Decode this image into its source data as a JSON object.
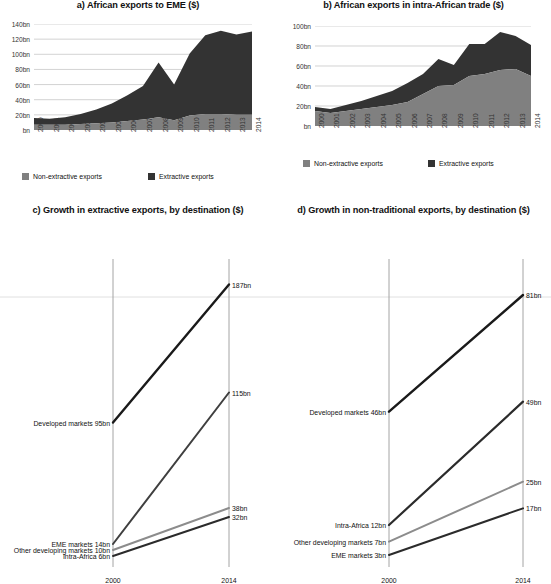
{
  "colors": {
    "non_extractive": "#808080",
    "extractive": "#333333",
    "grid": "#bfbfbf",
    "axis": "#aaaaaa",
    "text": "#111111"
  },
  "panel_a": {
    "title": "a) African exports to EME ($)",
    "ylabels": [
      "140bn",
      "120bn",
      "100bn",
      "80bn",
      "60bn",
      "40bn",
      "20bn",
      "bn"
    ],
    "xlabels": [
      "2000",
      "2001",
      "2002",
      "2003",
      "2004",
      "2005",
      "2006",
      "2007",
      "2008",
      "2009",
      "2010",
      "2011",
      "2012",
      "2013",
      "2014"
    ],
    "legend": [
      {
        "label": "Non-extractive exports",
        "color": "#808080"
      },
      {
        "label": "Extractive exports",
        "color": "#333333"
      }
    ]
  },
  "panel_b": {
    "title": "b) African exports in intra-African trade ($)",
    "ylabels": [
      "100bn",
      "80bn",
      "60bn",
      "40bn",
      "20bn",
      "bn"
    ],
    "xlabels": [
      "2000",
      "2001",
      "2002",
      "2003",
      "2004",
      "2005",
      "2006",
      "2007",
      "2008",
      "2009",
      "2010",
      "2011",
      "2012",
      "2013",
      "2014"
    ],
    "legend": [
      {
        "label": "Non-extractive exports",
        "color": "#808080"
      },
      {
        "label": "Extractive exports",
        "color": "#333333"
      }
    ]
  },
  "panel_c": {
    "title": "c) Growth in extractive exports, by destination ($)",
    "x_start_label": "2000",
    "x_end_label": "2014",
    "series": [
      {
        "name": "Developed markets",
        "left_label": "Developed markets 95bn",
        "right_label": "187bn",
        "start": 95,
        "end": 187,
        "color": "#1a1a1a",
        "width": 2.4
      },
      {
        "name": "EME markets",
        "left_label": "EME markets 14bn",
        "right_label": "115bn",
        "start": 14,
        "end": 115,
        "color": "#3f3f3f",
        "width": 2.0
      },
      {
        "name": "Other developing markets",
        "left_label": "Other developing markets 10bn",
        "right_label": "38bn",
        "start": 10,
        "end": 38,
        "color": "#8c8c8c",
        "width": 2.0
      },
      {
        "name": "Intra-Africa",
        "left_label": "Intra-Africa 6bn",
        "right_label": "32bn",
        "start": 6,
        "end": 32,
        "color": "#2b2b2b",
        "width": 2.0
      }
    ]
  },
  "panel_d": {
    "title": "d) Growth in non-traditional exports, by destination ($)",
    "x_start_label": "2000",
    "x_end_label": "2014",
    "series": [
      {
        "name": "Developed markets",
        "left_label": "Developed markets 46bn",
        "right_label": "81bn",
        "start": 46,
        "end": 81,
        "color": "#1a1a1a",
        "width": 2.4
      },
      {
        "name": "Intra-Africa",
        "left_label": "Intra-Africa 12bn",
        "right_label": "49bn",
        "start": 12,
        "end": 49,
        "color": "#2b2b2b",
        "width": 2.2
      },
      {
        "name": "Other developing markets",
        "left_label": "Other developing markets 7bn",
        "right_label": "25bn",
        "start": 7,
        "end": 25,
        "color": "#8c8c8c",
        "width": 2.0
      },
      {
        "name": "EME markets",
        "left_label": "EME markets 3bn",
        "right_label": "17bn",
        "start": 3,
        "end": 17,
        "color": "#2b2b2b",
        "width": 2.0
      }
    ]
  },
  "chart_data": [
    {
      "id": "a",
      "type": "area",
      "stacked": true,
      "title": "a) African exports to EME ($)",
      "xlabel": "",
      "ylabel": "",
      "ylim": [
        0,
        140
      ],
      "grid": true,
      "legend_position": "bottom",
      "x": [
        "2000",
        "2001",
        "2002",
        "2003",
        "2004",
        "2005",
        "2006",
        "2007",
        "2008",
        "2009",
        "2010",
        "2011",
        "2012",
        "2013",
        "2014"
      ],
      "series": [
        {
          "name": "Non-extractive exports",
          "color": "#808080",
          "values": [
            7,
            7,
            7,
            8,
            9,
            10,
            12,
            14,
            17,
            13,
            19,
            21,
            21,
            20,
            20
          ]
        },
        {
          "name": "Extractive exports",
          "color": "#333333",
          "values": [
            9,
            8,
            10,
            13,
            18,
            25,
            34,
            44,
            72,
            47,
            82,
            104,
            110,
            106,
            110
          ]
        }
      ],
      "totals": [
        16,
        15,
        17,
        21,
        27,
        35,
        46,
        58,
        89,
        60,
        101,
        125,
        131,
        126,
        130
      ]
    },
    {
      "id": "b",
      "type": "area",
      "stacked": true,
      "title": "b) African exports in intra-African trade ($)",
      "xlabel": "",
      "ylabel": "",
      "ylim": [
        0,
        100
      ],
      "grid": true,
      "legend_position": "bottom",
      "x": [
        "2000",
        "2001",
        "2002",
        "2003",
        "2004",
        "2005",
        "2006",
        "2007",
        "2008",
        "2009",
        "2010",
        "2011",
        "2012",
        "2013",
        "2014"
      ],
      "series": [
        {
          "name": "Non-extractive exports",
          "color": "#808080",
          "values": [
            15,
            13,
            15,
            17,
            19,
            21,
            24,
            32,
            40,
            41,
            50,
            52,
            56,
            57,
            50
          ]
        },
        {
          "name": "Extractive exports",
          "color": "#333333",
          "values": [
            4,
            4,
            6,
            8,
            11,
            14,
            19,
            20,
            27,
            20,
            32,
            30,
            38,
            33,
            31
          ]
        }
      ],
      "totals": [
        19,
        17,
        21,
        25,
        30,
        35,
        43,
        52,
        67,
        61,
        82,
        82,
        94,
        90,
        81
      ]
    },
    {
      "id": "c",
      "type": "line",
      "title": "c) Growth in extractive exports, by destination ($)",
      "xlabel": "",
      "ylabel": "",
      "x": [
        "2000",
        "2014"
      ],
      "series": [
        {
          "name": "Developed markets",
          "values": [
            95,
            187
          ],
          "color": "#1a1a1a"
        },
        {
          "name": "EME markets",
          "values": [
            14,
            115
          ],
          "color": "#3f3f3f"
        },
        {
          "name": "Other developing markets",
          "values": [
            10,
            38
          ],
          "color": "#8c8c8c"
        },
        {
          "name": "Intra-Africa",
          "values": [
            6,
            32
          ],
          "color": "#2b2b2b"
        }
      ]
    },
    {
      "id": "d",
      "type": "line",
      "title": "d) Growth in non-traditional exports, by destination ($)",
      "xlabel": "",
      "ylabel": "",
      "x": [
        "2000",
        "2014"
      ],
      "series": [
        {
          "name": "Developed markets",
          "values": [
            46,
            81
          ],
          "color": "#1a1a1a"
        },
        {
          "name": "Intra-Africa",
          "values": [
            12,
            49
          ],
          "color": "#2b2b2b"
        },
        {
          "name": "Other developing markets",
          "values": [
            7,
            25
          ],
          "color": "#8c8c8c"
        },
        {
          "name": "EME markets",
          "values": [
            3,
            17
          ],
          "color": "#2b2b2b"
        }
      ]
    }
  ]
}
